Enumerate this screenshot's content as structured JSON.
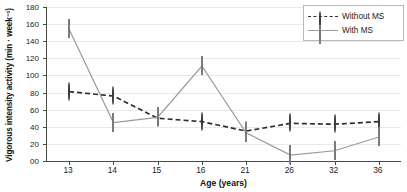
{
  "chart_data": {
    "type": "line",
    "title": "",
    "xlabel": "Age (years)",
    "ylabel": "Vigorous intensity activity (min · week⁻¹)",
    "categories": [
      "13",
      "14",
      "15",
      "16",
      "21",
      "26",
      "32",
      "36"
    ],
    "series": [
      {
        "name": "Without MS",
        "marker": "circle",
        "line_style": "dashed",
        "color": "#2e2e2e",
        "marker_fill": "#8e8e8e",
        "values": [
          81,
          76,
          50,
          46,
          35,
          44,
          43,
          46
        ]
      },
      {
        "name": "With MS",
        "marker": "square",
        "line_style": "solid",
        "color": "#9a9a9a",
        "marker_fill": "#b3b3b3",
        "values": [
          154,
          45,
          51,
          111,
          33,
          7,
          12,
          28
        ]
      }
    ],
    "ylim": [
      0,
      180
    ],
    "ytick_values": [
      0,
      20,
      40,
      60,
      80,
      100,
      120,
      140,
      160,
      180
    ],
    "ytick_labels": [
      "00",
      "20",
      "40",
      "60",
      "80",
      "100",
      "120",
      "140",
      "160",
      "180"
    ],
    "grid": true,
    "grid_axis": "y",
    "legend_position": "top-right",
    "legend_entries": [
      "Without MS",
      "With MS"
    ]
  }
}
